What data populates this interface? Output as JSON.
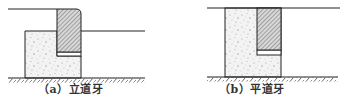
{
  "figure": {
    "panels": [
      {
        "id": "a",
        "label": "（a）立道牙",
        "type": "upright-curb",
        "components": [
          "pavement-surface-left",
          "curb-stone",
          "sidewalk-surface-right",
          "concrete-base",
          "ground"
        ]
      },
      {
        "id": "b",
        "label": "（b）平道牙",
        "type": "flat-curb",
        "components": [
          "pavement-surface",
          "concrete-base",
          "curb-stone",
          "ground"
        ]
      }
    ],
    "colors": {
      "line": "#222222",
      "hatch": "#555555",
      "concrete_fill": "#f2f2f2",
      "concrete_dots": "#999999",
      "background": "#ffffff"
    }
  }
}
